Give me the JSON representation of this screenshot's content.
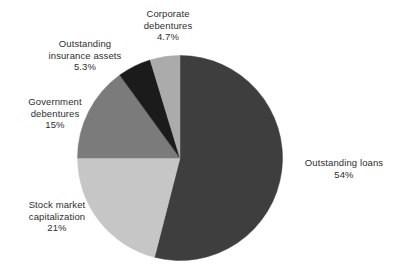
{
  "chart_data": {
    "type": "pie",
    "title": "",
    "subtitle": "",
    "xlabel": "",
    "ylabel": "",
    "legend_position": "none",
    "grid": false,
    "start_angle_deg": 0,
    "direction": "clockwise",
    "categories": [
      "Outstanding loans",
      "Stock market capitalization",
      "Government debentures",
      "Outstanding insurance assets",
      "Corporate debentures"
    ],
    "values": [
      54,
      21,
      15,
      5.3,
      4.7
    ],
    "value_labels": [
      "54%",
      "21%",
      "15%",
      "5.3%",
      "4.7%"
    ],
    "colors": [
      "#3e3e3e",
      "#c6c6c6",
      "#7b7b7b",
      "#1b1b1b",
      "#ababab"
    ],
    "slices": [
      {
        "name": "Outstanding loans",
        "value": 54,
        "value_label": "54%",
        "color": "#3e3e3e",
        "start_deg": 0,
        "end_deg": 194.4
      },
      {
        "name": "Stock market capitalization",
        "value": 21,
        "value_label": "21%",
        "color": "#c6c6c6",
        "start_deg": 194.4,
        "end_deg": 270
      },
      {
        "name": "Government debentures",
        "value": 15,
        "value_label": "15%",
        "color": "#7b7b7b",
        "start_deg": 270,
        "end_deg": 324
      },
      {
        "name": "Outstanding insurance assets",
        "value": 5.3,
        "value_label": "5.3%",
        "color": "#1b1b1b",
        "start_deg": 324,
        "end_deg": 343.08
      },
      {
        "name": "Corporate debentures",
        "value": 4.7,
        "value_label": "4.7%",
        "color": "#ababab",
        "start_deg": 343.08,
        "end_deg": 360
      }
    ]
  },
  "labels": {
    "corporate": {
      "line1": "Corporate",
      "line2": "debentures",
      "value": "4.7%"
    },
    "insurance": {
      "line1": "Outstanding",
      "line2": "insurance assets",
      "value": "5.3%"
    },
    "government": {
      "line1": "Government",
      "line2": "debentures",
      "value": "15%"
    },
    "stock": {
      "line1": "Stock market",
      "line2": "capitalization",
      "value": "21%"
    },
    "loans": {
      "line1": "Outstanding loans",
      "value": "54%"
    }
  }
}
